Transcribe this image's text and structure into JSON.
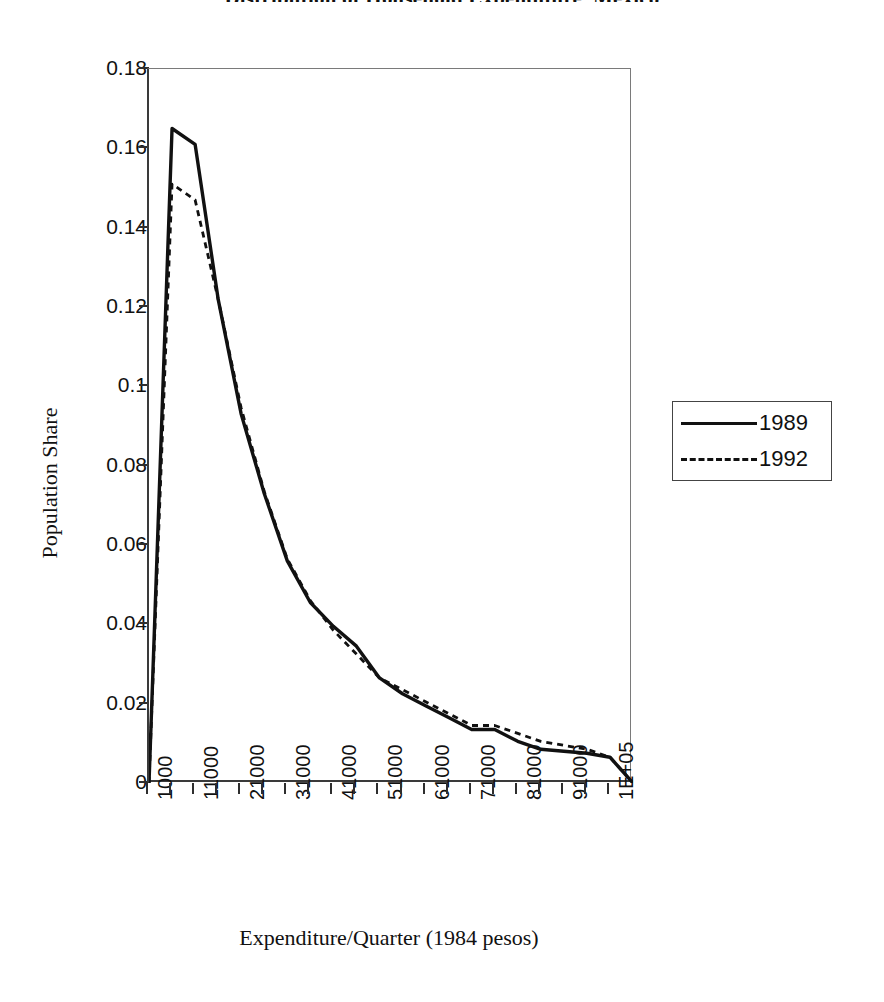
{
  "chart_data": {
    "type": "line",
    "title": "Distribution of Household Expenditure, Mexico",
    "title_visible": "clipped at top edge of image",
    "xlabel": "Expenditure/Quarter (1984 pesos)",
    "ylabel": "Population Share",
    "grid": false,
    "legend_position": "right outside",
    "ylim": [
      0,
      0.18
    ],
    "yticks": [
      "0",
      "0.02",
      "0.04",
      "0.06",
      "0.08",
      "0.1",
      "0.12",
      "0.14",
      "0.16",
      "0.18"
    ],
    "ytick_values": [
      0,
      0.02,
      0.04,
      0.06,
      0.08,
      0.1,
      0.12,
      0.14,
      0.16,
      0.18
    ],
    "xticks": [
      "1000",
      "11000",
      "21000",
      "31000",
      "41000",
      "51000",
      "61000",
      "71000",
      "81000",
      "91000",
      "1E+05"
    ],
    "xtick_values": [
      1000,
      11000,
      21000,
      31000,
      41000,
      51000,
      61000,
      71000,
      81000,
      91000,
      101000
    ],
    "xtick_minor_between": true,
    "x": [
      1000,
      6000,
      11000,
      16000,
      21000,
      26000,
      31000,
      36000,
      41000,
      46000,
      51000,
      56000,
      61000,
      66000,
      71000,
      76000,
      81000,
      86000,
      91000,
      96000,
      101000,
      106000
    ],
    "series": [
      {
        "name": "1989",
        "style": "solid",
        "color": "#111111",
        "values": [
          0.0,
          0.165,
          0.161,
          0.122,
          0.093,
          0.073,
          0.056,
          0.0455,
          0.0395,
          0.0345,
          0.0265,
          0.0225,
          0.0195,
          0.0165,
          0.0135,
          0.0135,
          0.0105,
          0.0085,
          0.008,
          0.0075,
          0.0065,
          0.0
        ]
      },
      {
        "name": "1992",
        "style": "dashed",
        "color": "#111111",
        "values": [
          0.0,
          0.151,
          0.147,
          0.122,
          0.0945,
          0.0735,
          0.0565,
          0.046,
          0.0385,
          0.0325,
          0.0265,
          0.0235,
          0.0205,
          0.0175,
          0.0145,
          0.0145,
          0.0125,
          0.0105,
          0.0095,
          0.0085,
          0.0065,
          0.0
        ]
      }
    ]
  },
  "legend": {
    "entries": [
      {
        "label": "1989",
        "style": "solid"
      },
      {
        "label": "1992",
        "style": "dashed"
      }
    ]
  }
}
